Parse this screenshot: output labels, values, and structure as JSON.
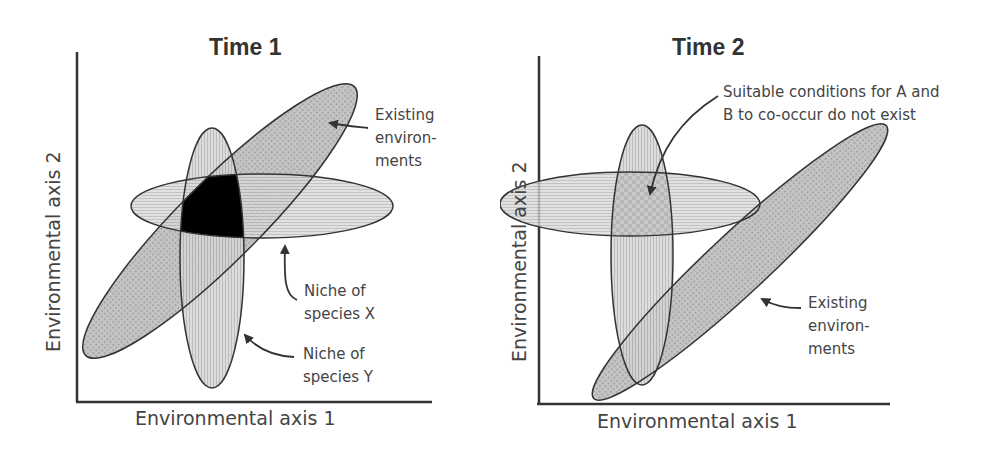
{
  "figure": {
    "panels": [
      {
        "title": "Time 1",
        "xlabel": "Environmental axis 1",
        "ylabel": "Environmental axis 2",
        "annotations": {
          "existing": "Existing\nenviron-\nments",
          "niche_x": "Niche of\nspecies X",
          "niche_y": "Niche of\nspecies Y"
        }
      },
      {
        "title": "Time 2",
        "xlabel": "Environmental axis 1",
        "ylabel": "Environmental axis 2",
        "annotations": {
          "no_cooccur": "Suitable conditions for A and\nB to co-occur do not exist",
          "existing": "Existing\nenviron-\nments"
        }
      }
    ],
    "colors": {
      "existing_fill": "#8f8f8f",
      "niche_fill": "#d4d4d4",
      "overlap_fill": "#000000",
      "outline": "#333333",
      "text": "#444444"
    }
  }
}
